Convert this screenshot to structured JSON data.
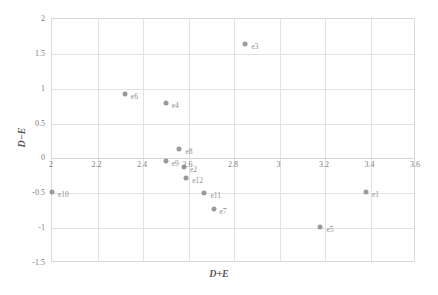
{
  "chart_data": {
    "type": "scatter",
    "title": "",
    "xlabel": "D+E",
    "ylabel": "D−E",
    "xlim": [
      2,
      3.6
    ],
    "ylim": [
      -1.5,
      2
    ],
    "grid": true,
    "legend": "none",
    "xticks": [
      "2",
      "2.2",
      "2.4",
      "2.6",
      "2.8",
      "3",
      "3.2",
      "3.4",
      "3.6"
    ],
    "xtick_values": [
      2,
      2.2,
      2.4,
      2.6,
      2.8,
      3,
      3.2,
      3.4,
      3.6
    ],
    "yticks": [
      "2",
      "1.5",
      "1",
      "0.5",
      "0",
      "-0.5",
      "-1",
      "-1.5"
    ],
    "ytick_values": [
      2,
      1.5,
      1,
      0.5,
      0,
      -0.5,
      -1,
      -1.5
    ],
    "marker_color": "#9a9a9a",
    "label_color": "#8e8e8e",
    "points": [
      {
        "label": "e1",
        "x": 3.38,
        "y": -0.48
      },
      {
        "label": "e2",
        "x": 2.58,
        "y": -0.12
      },
      {
        "label": "e3",
        "x": 2.85,
        "y": 1.64
      },
      {
        "label": "e4",
        "x": 2.5,
        "y": 0.8
      },
      {
        "label": "e5",
        "x": 3.18,
        "y": -0.98
      },
      {
        "label": "e6",
        "x": 2.32,
        "y": 0.92
      },
      {
        "label": "e7",
        "x": 2.71,
        "y": -0.72
      },
      {
        "label": "e8",
        "x": 2.56,
        "y": 0.13
      },
      {
        "label": "e9",
        "x": 2.5,
        "y": -0.03
      },
      {
        "label": "e10",
        "x": 2.0,
        "y": -0.48
      },
      {
        "label": "e11",
        "x": 2.67,
        "y": -0.5
      },
      {
        "label": "e12",
        "x": 2.59,
        "y": -0.28
      }
    ]
  }
}
